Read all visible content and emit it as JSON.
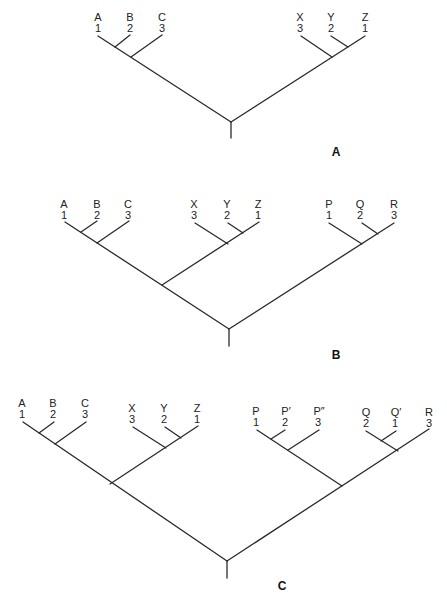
{
  "figure": {
    "panels": [
      {
        "id": "A",
        "label": "A",
        "groups": [
          {
            "name": "ABC",
            "taxa": [
              {
                "name": "A",
                "order": "1"
              },
              {
                "name": "B",
                "order": "2"
              },
              {
                "name": "C",
                "order": "3"
              }
            ]
          },
          {
            "name": "XYZ",
            "taxa": [
              {
                "name": "X",
                "order": "3"
              },
              {
                "name": "Y",
                "order": "2"
              },
              {
                "name": "Z",
                "order": "1"
              }
            ]
          }
        ]
      },
      {
        "id": "B",
        "label": "B",
        "groups": [
          {
            "name": "ABC",
            "taxa": [
              {
                "name": "A",
                "order": "1"
              },
              {
                "name": "B",
                "order": "2"
              },
              {
                "name": "C",
                "order": "3"
              }
            ]
          },
          {
            "name": "XYZ",
            "taxa": [
              {
                "name": "X",
                "order": "3"
              },
              {
                "name": "Y",
                "order": "2"
              },
              {
                "name": "Z",
                "order": "1"
              }
            ]
          },
          {
            "name": "PQR",
            "taxa": [
              {
                "name": "P",
                "order": "1"
              },
              {
                "name": "Q",
                "order": "2"
              },
              {
                "name": "R",
                "order": "3"
              }
            ]
          }
        ]
      },
      {
        "id": "C",
        "label": "C",
        "groups": [
          {
            "name": "ABC",
            "taxa": [
              {
                "name": "A",
                "order": "1"
              },
              {
                "name": "B",
                "order": "2"
              },
              {
                "name": "C",
                "order": "3"
              }
            ]
          },
          {
            "name": "XYZ",
            "taxa": [
              {
                "name": "X",
                "order": "3"
              },
              {
                "name": "Y",
                "order": "2"
              },
              {
                "name": "Z",
                "order": "1"
              }
            ]
          },
          {
            "name": "P-group",
            "taxa": [
              {
                "name": "P",
                "order": "1"
              },
              {
                "name": "P′",
                "order": "2"
              },
              {
                "name": "P″",
                "order": "3"
              }
            ]
          },
          {
            "name": "Q-group",
            "taxa": [
              {
                "name": "Q",
                "order": "2"
              },
              {
                "name": "Q′",
                "order": "1"
              },
              {
                "name": "R",
                "order": "3"
              }
            ]
          }
        ]
      }
    ]
  }
}
